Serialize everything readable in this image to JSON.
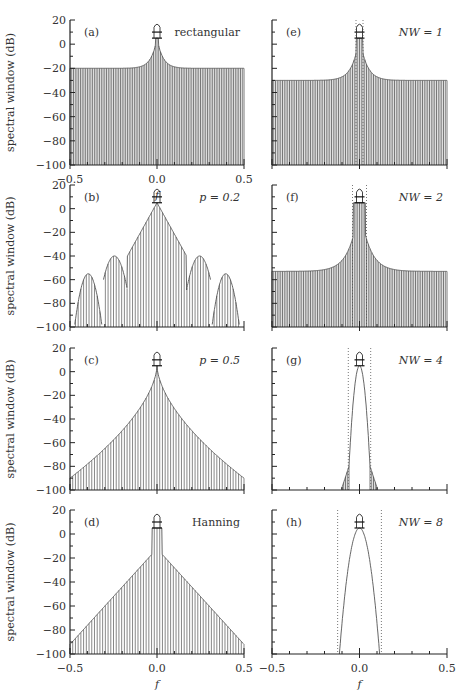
{
  "figure": {
    "ylabel": "spectral window (dB)",
    "xlabel": "f",
    "line_color": "#555555",
    "axis_color": "#222222"
  },
  "chart_data": [
    {
      "panel": "(a)",
      "label": "rectangular",
      "type": "line",
      "window": "rectangular",
      "column": 0,
      "row": 0,
      "xlim": [
        -0.5,
        0.5
      ],
      "ylim": [
        -100,
        20
      ],
      "yticks": [
        20,
        0,
        -20,
        -40,
        -60,
        -80,
        -100
      ],
      "xticks": [
        -0.5,
        0.0,
        0.5
      ],
      "xticklabels": [
        "−0.5",
        "0.0",
        "0.5"
      ],
      "peak_db": 5,
      "sidelobe_floor_db": -20,
      "dense_lines": true
    },
    {
      "panel": "(b)",
      "label": "p = 0.2",
      "type": "line",
      "window": "split-cosine p=0.2",
      "column": 0,
      "row": 1,
      "xlim": [
        -0.5,
        0.5
      ],
      "ylim": [
        -100,
        20
      ],
      "yticks": [
        20,
        0,
        -20,
        -40,
        -60,
        -80,
        -100
      ],
      "xticks": [
        -0.5,
        0.0,
        0.5
      ],
      "peak_db": 5,
      "lobe_groups": [
        {
          "f": 0.0,
          "db": 5
        },
        {
          "f": 0.25,
          "db": -40
        },
        {
          "f": 0.4,
          "db": -55
        }
      ]
    },
    {
      "panel": "(c)",
      "label": "p = 0.5",
      "type": "line",
      "window": "split-cosine p=0.5",
      "column": 0,
      "row": 2,
      "xlim": [
        -0.5,
        0.5
      ],
      "ylim": [
        -100,
        20
      ],
      "yticks": [
        20,
        0,
        -20,
        -40,
        -60,
        -80,
        -100
      ],
      "xticks": [
        -0.5,
        0.0,
        0.5
      ],
      "peak_db": 5,
      "sidelobe_at_edge_db": -90
    },
    {
      "panel": "(d)",
      "label": "Hanning",
      "type": "line",
      "window": "Hanning",
      "column": 0,
      "row": 3,
      "xlim": [
        -0.5,
        0.5
      ],
      "ylim": [
        -100,
        20
      ],
      "yticks": [
        20,
        0,
        -20,
        -40,
        -60,
        -80,
        -100
      ],
      "xticks": [
        -0.5,
        0.0,
        0.5
      ],
      "xticklabels": [
        "−0.5",
        "0.0",
        "0.5"
      ],
      "peak_db": 5,
      "first_sidelobe_db": -17,
      "sidelobe_at_edge_db": -92
    },
    {
      "panel": "(e)",
      "label": "NW = 1",
      "type": "line",
      "window": "dpss NW=1",
      "column": 1,
      "row": 0,
      "xlim": [
        -0.5,
        0.5
      ],
      "ylim": [
        -100,
        20
      ],
      "xticks": [
        -0.5,
        0.0,
        0.5
      ],
      "peak_db": 5,
      "bandwidth_W": 0.02,
      "sidelobe_floor_db": -30
    },
    {
      "panel": "(f)",
      "label": "NW = 2",
      "type": "line",
      "window": "dpss NW=2",
      "column": 1,
      "row": 1,
      "xlim": [
        -0.5,
        0.5
      ],
      "ylim": [
        -100,
        20
      ],
      "xticks": [
        -0.5,
        0.0,
        0.5
      ],
      "peak_db": 5,
      "bandwidth_W": 0.04,
      "sidelobe_floor_db": -53
    },
    {
      "panel": "(g)",
      "label": "NW = 4",
      "type": "line",
      "window": "dpss NW=4",
      "column": 1,
      "row": 2,
      "xlim": [
        -0.5,
        0.5
      ],
      "ylim": [
        -100,
        20
      ],
      "xticks": [
        -0.5,
        0.0,
        0.5
      ],
      "peak_db": 5,
      "bandwidth_W": 0.064,
      "sidelobe_floor_db": -100
    },
    {
      "panel": "(h)",
      "label": "NW = 8",
      "type": "line",
      "window": "dpss NW=8",
      "column": 1,
      "row": 3,
      "xlim": [
        -0.5,
        0.5
      ],
      "ylim": [
        -100,
        20
      ],
      "xticks": [
        -0.5,
        0.0,
        0.5
      ],
      "xticklabels": [
        "−0.5",
        "0.0",
        "0.5"
      ],
      "peak_db": 5,
      "bandwidth_W": 0.125,
      "sidelobe_floor_db": -100
    }
  ]
}
